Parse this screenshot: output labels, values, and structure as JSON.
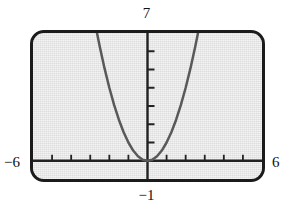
{
  "figure": {
    "kind": "graphing-calculator-viewing-window",
    "screen_fill_color": "#e4e4e4",
    "frame_color": "#1b1b1b",
    "curve_color": "#595959",
    "axis_color": "#222222"
  },
  "labels": {
    "y_max": "7",
    "y_min": "−1",
    "x_min": "−6",
    "x_max": "6"
  },
  "chart_data": {
    "type": "line",
    "title": "",
    "subtitle": "",
    "xlabel": "",
    "ylabel": "",
    "grid": false,
    "legend": "none",
    "xlim": [
      -6,
      6
    ],
    "ylim": [
      -1,
      7
    ],
    "xticks": [
      -6,
      -5,
      -4,
      -3,
      -2,
      -1,
      0,
      1,
      2,
      3,
      4,
      5,
      6
    ],
    "yticks": [
      -1,
      0,
      1,
      2,
      3,
      4,
      5,
      6,
      7
    ],
    "xtick_labels": [
      "−6",
      "",
      "",
      "",
      "",
      "",
      "",
      "",
      "",
      "",
      "",
      "",
      "6"
    ],
    "ytick_labels": [
      "−1",
      "",
      "",
      "",
      "",
      "",
      "",
      "",
      "7"
    ],
    "tick_marks_only": true,
    "annotations": [],
    "series": [
      {
        "name": "y = x^2",
        "equation": "y = x²",
        "shape": "parabola",
        "vertex": [
          0,
          0
        ],
        "opens": "up",
        "leading_coefficient": 1,
        "x": [
          -2.65,
          -2.5,
          -2.25,
          -2.0,
          -1.75,
          -1.5,
          -1.25,
          -1.0,
          -0.75,
          -0.5,
          -0.25,
          0,
          0.25,
          0.5,
          0.75,
          1.0,
          1.25,
          1.5,
          1.75,
          2.0,
          2.25,
          2.5,
          2.65
        ],
        "values": [
          7.02,
          6.25,
          5.06,
          4.0,
          3.06,
          2.25,
          1.56,
          1.0,
          0.56,
          0.25,
          0.06,
          0,
          0.06,
          0.25,
          0.56,
          1.0,
          1.56,
          2.25,
          3.06,
          4.0,
          5.06,
          6.25,
          7.02
        ]
      }
    ]
  }
}
